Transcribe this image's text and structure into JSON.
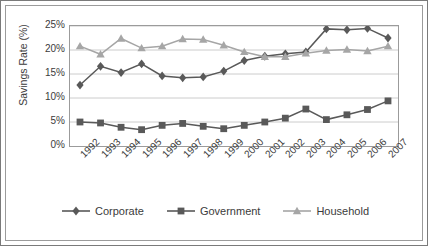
{
  "chart_data": {
    "type": "line",
    "title": "",
    "xlabel": "",
    "ylabel": "Savings Rate (%)",
    "categories": [
      "1992",
      "1993",
      "1994",
      "1995",
      "1996",
      "1997",
      "1998",
      "1999",
      "2000",
      "2001",
      "2002",
      "2003",
      "2004",
      "2005",
      "2006",
      "2007"
    ],
    "ylim": [
      0,
      25
    ],
    "ytick_labels": [
      "0%",
      "5%",
      "10%",
      "15%",
      "20%",
      "25%"
    ],
    "ytick_values": [
      0,
      5,
      10,
      15,
      20,
      25
    ],
    "grid": true,
    "legend_position": "bottom",
    "series": [
      {
        "name": "Corporate",
        "marker": "diamond",
        "color": "#595959",
        "values": [
          12.7,
          16.6,
          15.3,
          17.1,
          14.6,
          14.2,
          14.4,
          15.6,
          17.8,
          18.7,
          19.2,
          19.6,
          24.4,
          24.2,
          24.5,
          22.5
        ]
      },
      {
        "name": "Government",
        "marker": "square",
        "color": "#595959",
        "values": [
          5.0,
          4.8,
          3.9,
          3.4,
          4.3,
          4.7,
          4.1,
          3.6,
          4.3,
          5.0,
          5.8,
          7.7,
          5.5,
          6.5,
          7.6,
          9.4
        ]
      },
      {
        "name": "Household",
        "marker": "triangle",
        "color": "#a6a6a6",
        "values": [
          20.8,
          19.1,
          22.4,
          20.4,
          20.8,
          22.3,
          22.2,
          21.0,
          19.6,
          18.6,
          18.6,
          19.3,
          19.9,
          20.1,
          19.8,
          20.8
        ]
      }
    ]
  },
  "legend": {
    "items": [
      {
        "label": "Corporate"
      },
      {
        "label": "Government"
      },
      {
        "label": "Household"
      }
    ]
  }
}
